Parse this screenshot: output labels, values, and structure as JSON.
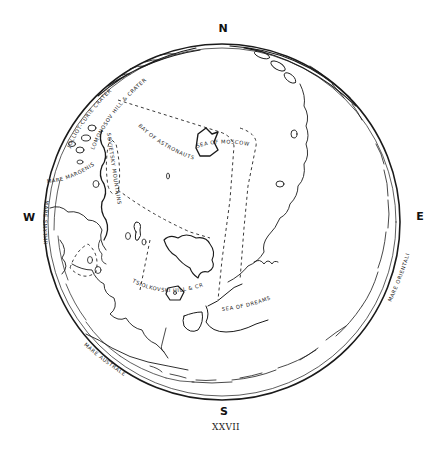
{
  "map": {
    "title": "Far side of the Moon",
    "plate_number": "XXVII",
    "compass": {
      "north": "N",
      "south": "S",
      "east": "E",
      "west": "W"
    },
    "features": [
      {
        "id": "sea-of-moscow",
        "label": "SEA OF MOSCOW"
      },
      {
        "id": "bay-of-astronauts",
        "label": "BAY OF ASTRONAUTS"
      },
      {
        "id": "jolliot-curie-crater",
        "label": "JOLLIOT-CURIE CRATER"
      },
      {
        "id": "lomonosov-hill-crater",
        "label": "LOMONOSOV HILL & CRATER"
      },
      {
        "id": "sovietsky-mountains",
        "label": "SOVIETSKY MOUNTAINS"
      },
      {
        "id": "mare-margenis",
        "label": "MARE MARGENIS"
      },
      {
        "id": "mare-smythii",
        "label": "MARE SMYTHII"
      },
      {
        "id": "tsiolkovski-hill-crater",
        "label": "TSIOLKOVSKI HILL & CRATER"
      },
      {
        "id": "sea-of-dreams",
        "label": "SEA OF DREAMS"
      },
      {
        "id": "mare-australe",
        "label": "MARE AUSTRALE"
      },
      {
        "id": "mare-orientalis",
        "label": "MARE ORIENTALIS"
      }
    ],
    "colors": {
      "ink": "#1a1a1a",
      "paper": "#ffffff"
    }
  }
}
